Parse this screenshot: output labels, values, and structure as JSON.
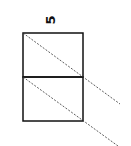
{
  "diagram": {
    "label": "5",
    "stroke_color": "#111111",
    "boxes": [
      {
        "x": 23,
        "y": 33,
        "width": 60,
        "height": 44
      },
      {
        "x": 23,
        "y": 77,
        "width": 60,
        "height": 44
      }
    ],
    "dashed_lines": [
      {
        "x1": 23,
        "y1": 33,
        "x2": 120,
        "y2": 104
      },
      {
        "x1": 23,
        "y1": 77,
        "x2": 118,
        "y2": 146
      }
    ]
  }
}
